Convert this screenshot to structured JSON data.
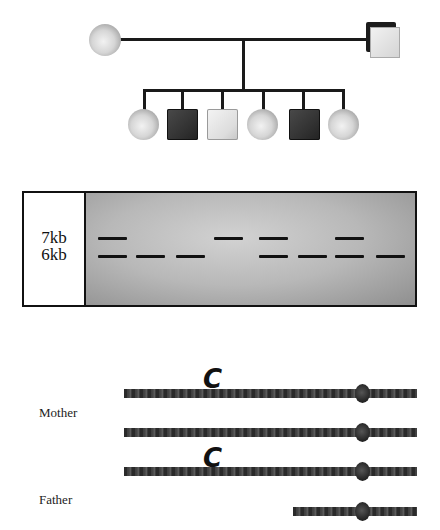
{
  "pedigree": {
    "parents": [
      {
        "id": "mother",
        "sex": "female",
        "symbol": "circle",
        "affected": false
      },
      {
        "id": "father",
        "sex": "male",
        "symbol": "square",
        "affected": false
      }
    ],
    "children": [
      {
        "order": 1,
        "sex": "female",
        "symbol": "circle",
        "affected": false
      },
      {
        "order": 2,
        "sex": "male",
        "symbol": "square",
        "affected": true
      },
      {
        "order": 3,
        "sex": "male",
        "symbol": "square",
        "affected": false
      },
      {
        "order": 4,
        "sex": "female",
        "symbol": "circle",
        "affected": false
      },
      {
        "order": 5,
        "sex": "male",
        "symbol": "square",
        "affected": true
      },
      {
        "order": 6,
        "sex": "female",
        "symbol": "circle",
        "affected": false
      }
    ]
  },
  "gel": {
    "labels": {
      "band_7kb": "7kb",
      "band_6kb": "6kb"
    },
    "lanes": [
      {
        "lane": 1,
        "bands": [
          "7kb",
          "6kb"
        ]
      },
      {
        "lane": 2,
        "bands": [
          "6kb"
        ]
      },
      {
        "lane": 3,
        "bands": [
          "6kb"
        ]
      },
      {
        "lane": 4,
        "bands": [
          "7kb"
        ]
      },
      {
        "lane": 5,
        "bands": [
          "7kb",
          "6kb"
        ]
      },
      {
        "lane": 6,
        "bands": [
          "6kb"
        ]
      },
      {
        "lane": 7,
        "bands": [
          "7kb",
          "6kb"
        ]
      },
      {
        "lane": 8,
        "bands": [
          "6kb"
        ]
      }
    ]
  },
  "chromosomes": {
    "mother_label": "Mother",
    "father_label": "Father",
    "allele_marker": "C",
    "items": [
      {
        "parent": "Mother",
        "has_allele": true
      },
      {
        "parent": "Mother",
        "has_allele": false
      },
      {
        "parent": "Father",
        "has_allele": true
      },
      {
        "parent": "Father",
        "has_allele": false,
        "short": true
      }
    ]
  }
}
